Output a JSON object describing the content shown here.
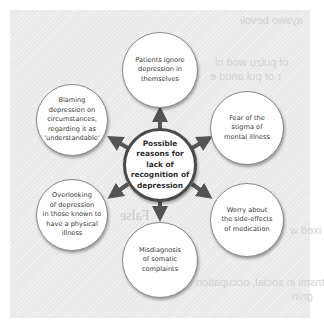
{
  "diagram": {
    "type": "radial-cause-diagram",
    "center": {
      "label": "Possible\nreasons for\nlack of\nrecognition of\ndepression"
    },
    "nodes": [
      {
        "id": "top",
        "label": "Patients ignore\ndepression in\nthemselves"
      },
      {
        "id": "upper-right",
        "label": "Fear of the\nstigma of\nmental illness"
      },
      {
        "id": "lower-right",
        "label": "Worry about\nthe side-effects\nof medication"
      },
      {
        "id": "bottom",
        "label": "Misdiagnosis\nof somatic\ncomplaints"
      },
      {
        "id": "lower-left",
        "label": "Overlooking\nof depression\nin those known to\nhave a physical\nillness"
      },
      {
        "id": "upper-left",
        "label": "Blaming\ndepression on\ncircumstances,\nregarding it as\n'understandable'"
      }
    ],
    "edges": [
      {
        "from": "center",
        "to": "top"
      },
      {
        "from": "center",
        "to": "upper-right"
      },
      {
        "from": "center",
        "to": "lower-right"
      },
      {
        "from": "center",
        "to": "bottom"
      },
      {
        "from": "center",
        "to": "lower-left"
      },
      {
        "from": "center",
        "to": "upper-left"
      }
    ],
    "colors": {
      "panel": "#e9e9e9",
      "arrow": "#555555",
      "circle_fill": "#ffffff",
      "center_border": "#4a4a4a"
    }
  },
  "ghost_text": {
    "line1": "ayswo bevoli",
    "line2": "ot puizu wod ni",
    "line3": "r or pul anud e",
    "line4": "False",
    "line5": "ixed w",
    "line6": "tnsmi in social, occupation",
    "line7": "gnin"
  }
}
